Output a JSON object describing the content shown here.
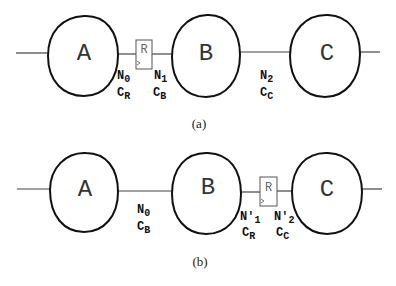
{
  "panels": [
    {
      "caption": "(a)",
      "nodes": [
        "A",
        "B",
        "C"
      ],
      "register": "R",
      "labels": [
        {
          "n": "N",
          "n_sub": "0",
          "c": "C",
          "c_sub": "R"
        },
        {
          "n": "N",
          "n_sub": "1",
          "c": "C",
          "c_sub": "B"
        },
        {
          "n": "N",
          "n_sub": "2",
          "c": "C",
          "c_sub": "C"
        }
      ]
    },
    {
      "caption": "(b)",
      "nodes": [
        "A",
        "B",
        "C"
      ],
      "register": "R",
      "labels": [
        {
          "n": "N",
          "n_sub": "0",
          "c": "C",
          "c_sub": "B"
        },
        {
          "n": "N′",
          "n_sub": "1",
          "c": "C",
          "c_sub": "R"
        },
        {
          "n": "N′",
          "n_sub": "2",
          "c": "C",
          "c_sub": "C"
        }
      ]
    }
  ],
  "colors": {
    "stroke": "#111111",
    "register_stroke": "#555555",
    "wire": "#444444"
  }
}
